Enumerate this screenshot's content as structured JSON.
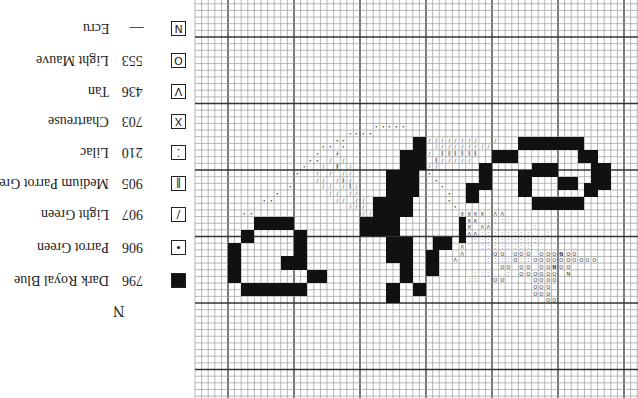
{
  "orientation": "rotated-180",
  "legend": {
    "title": "N",
    "items": [
      {
        "symbol": "N",
        "symbol_type": "letter",
        "code": "—",
        "name": "Ecru",
        "y": 21
      },
      {
        "symbol": "O",
        "symbol_type": "circle",
        "code": "553",
        "name": "Light Mauve",
        "y": 53
      },
      {
        "symbol": "V",
        "symbol_type": "v",
        "code": "436",
        "name": "Tan",
        "y": 84
      },
      {
        "symbol": "X",
        "symbol_type": "cross",
        "code": "703",
        "name": "Chartreuse",
        "y": 114
      },
      {
        "symbol": "⁚",
        "symbol_type": "two-dots",
        "code": "210",
        "name": "Lilac",
        "y": 145
      },
      {
        "symbol": "II",
        "symbol_type": "double-bar",
        "code": "905",
        "name": "Medium Parrot Green",
        "y": 176
      },
      {
        "symbol": "/",
        "symbol_type": "slash",
        "code": "907",
        "name": "Light Green",
        "y": 207
      },
      {
        "symbol": "•",
        "symbol_type": "dot",
        "code": "906",
        "name": "Parrot Green",
        "y": 240
      },
      {
        "symbol": "■",
        "symbol_type": "solid",
        "code": "796",
        "name": "Dark Royal Blue",
        "y": 273
      }
    ]
  },
  "grid": {
    "origin_x": 228,
    "origin_y": 37,
    "cell_w": 6.6,
    "cell_h": 6.65,
    "col_min": -5,
    "col_max": 62,
    "row_min": -6,
    "row_max": 54,
    "major_every": 10,
    "minor_color": "#9a9a9a",
    "major_color": "#333333"
  },
  "stitches": {
    "dark_royal_blue_rects": [
      [
        4,
        27,
        9,
        28
      ],
      [
        2,
        29,
        3,
        30
      ],
      [
        10,
        29,
        11,
        34
      ],
      [
        0,
        31,
        1,
        36
      ],
      [
        8,
        33,
        9,
        34
      ],
      [
        2,
        37,
        11,
        38
      ],
      [
        12,
        35,
        14,
        36
      ],
      [
        28,
        15,
        29,
        16
      ],
      [
        26,
        17,
        29,
        19
      ],
      [
        24,
        20,
        28,
        23
      ],
      [
        22,
        24,
        27,
        26
      ],
      [
        20,
        27,
        25,
        29
      ],
      [
        24,
        30,
        27,
        33
      ],
      [
        26,
        34,
        27,
        36
      ],
      [
        31,
        30,
        33,
        31
      ],
      [
        30,
        32,
        31,
        35
      ],
      [
        24,
        37,
        25,
        39
      ],
      [
        28,
        37,
        29,
        38
      ],
      [
        44,
        15,
        53,
        16
      ],
      [
        40,
        17,
        43,
        18
      ],
      [
        53,
        17,
        55,
        18
      ],
      [
        38,
        19,
        39,
        22
      ],
      [
        55,
        19,
        57,
        22
      ],
      [
        46,
        19,
        49,
        20
      ],
      [
        44,
        20,
        45,
        23
      ],
      [
        50,
        21,
        52,
        22
      ],
      [
        54,
        22,
        55,
        23
      ],
      [
        46,
        24,
        53,
        25
      ],
      [
        36,
        22,
        37,
        24
      ],
      [
        35,
        27,
        35,
        30
      ]
    ],
    "symbol_cells": [
      {
        "sym": "•",
        "cells": [
          [
            2,
            26
          ],
          [
            3,
            26
          ],
          [
            5,
            24
          ],
          [
            6,
            24
          ],
          [
            7,
            23
          ],
          [
            9,
            22
          ],
          [
            10,
            20
          ],
          [
            11,
            19
          ],
          [
            12,
            18
          ],
          [
            13,
            17
          ],
          [
            14,
            16
          ],
          [
            15,
            16
          ],
          [
            16,
            15
          ],
          [
            17,
            15
          ],
          [
            18,
            14
          ],
          [
            19,
            14
          ],
          [
            20,
            14
          ],
          [
            21,
            14
          ],
          [
            13,
            18
          ],
          [
            16,
            17
          ],
          [
            17,
            16
          ],
          [
            22,
            13
          ],
          [
            23,
            13
          ],
          [
            24,
            13
          ],
          [
            25,
            13
          ],
          [
            26,
            13
          ],
          [
            30,
            20
          ],
          [
            31,
            21
          ],
          [
            32,
            22
          ],
          [
            33,
            23
          ],
          [
            33,
            24
          ],
          [
            34,
            25
          ]
        ]
      },
      {
        "sym": "/",
        "cells": [
          [
            13,
            20
          ],
          [
            14,
            19
          ],
          [
            15,
            18
          ],
          [
            16,
            17
          ],
          [
            13,
            21
          ],
          [
            14,
            21
          ],
          [
            15,
            20
          ],
          [
            16,
            19
          ],
          [
            17,
            18
          ],
          [
            14,
            22
          ],
          [
            15,
            22
          ],
          [
            16,
            21
          ],
          [
            17,
            20
          ],
          [
            18,
            19
          ],
          [
            15,
            23
          ],
          [
            16,
            23
          ],
          [
            17,
            22
          ],
          [
            18,
            21
          ],
          [
            18,
            20
          ],
          [
            16,
            24
          ],
          [
            17,
            24
          ],
          [
            18,
            23
          ],
          [
            19,
            22
          ],
          [
            19,
            23
          ],
          [
            18,
            25
          ],
          [
            19,
            25
          ],
          [
            19,
            24
          ],
          [
            20,
            24
          ],
          [
            20,
            25
          ],
          [
            20,
            26
          ],
          [
            21,
            26
          ],
          [
            21,
            27
          ],
          [
            21,
            28
          ],
          [
            30,
            15
          ],
          [
            31,
            15
          ],
          [
            32,
            15
          ],
          [
            33,
            15
          ],
          [
            34,
            15
          ],
          [
            35,
            15
          ],
          [
            36,
            15
          ],
          [
            37,
            15
          ],
          [
            29,
            17
          ],
          [
            30,
            17
          ],
          [
            31,
            16
          ],
          [
            32,
            16
          ],
          [
            33,
            16
          ],
          [
            34,
            16
          ],
          [
            35,
            16
          ],
          [
            36,
            16
          ],
          [
            37,
            16
          ],
          [
            38,
            16
          ],
          [
            39,
            16
          ],
          [
            30,
            19
          ],
          [
            31,
            19
          ],
          [
            32,
            18
          ],
          [
            33,
            18
          ],
          [
            34,
            18
          ],
          [
            35,
            18
          ],
          [
            36,
            18
          ],
          [
            40,
            15
          ]
        ]
      },
      {
        "sym": "II",
        "cells": [
          [
            16,
            19
          ],
          [
            17,
            21
          ],
          [
            18,
            22
          ],
          [
            32,
            17
          ],
          [
            33,
            17
          ],
          [
            34,
            17
          ],
          [
            35,
            17
          ],
          [
            36,
            17
          ],
          [
            37,
            17
          ],
          [
            31,
            18
          ]
        ]
      },
      {
        "sym": "X",
        "cells": [
          [
            35,
            26
          ],
          [
            36,
            26
          ],
          [
            37,
            26
          ],
          [
            38,
            26
          ],
          [
            35,
            27
          ],
          [
            36,
            27
          ],
          [
            37,
            27
          ],
          [
            36,
            28
          ],
          [
            35,
            29
          ]
        ]
      },
      {
        "sym": "V",
        "cells": [
          [
            38,
            28
          ],
          [
            39,
            28
          ],
          [
            40,
            26
          ],
          [
            41,
            26
          ],
          [
            36,
            29
          ],
          [
            37,
            29
          ],
          [
            35,
            30
          ],
          [
            35,
            31
          ],
          [
            35,
            32
          ],
          [
            34,
            33
          ]
        ]
      },
      {
        "sym": "⁚",
        "cells": [
          [
            39,
            27
          ],
          [
            40,
            27
          ],
          [
            41,
            27
          ],
          [
            42,
            27
          ],
          [
            38,
            29
          ],
          [
            39,
            29
          ],
          [
            40,
            29
          ],
          [
            41,
            29
          ],
          [
            42,
            29
          ],
          [
            43,
            29
          ],
          [
            44,
            29
          ],
          [
            45,
            29
          ],
          [
            46,
            28
          ],
          [
            37,
            30
          ],
          [
            38,
            30
          ],
          [
            39,
            30
          ],
          [
            40,
            30
          ],
          [
            41,
            30
          ],
          [
            42,
            30
          ],
          [
            43,
            30
          ],
          [
            44,
            30
          ],
          [
            45,
            30
          ],
          [
            46,
            30
          ],
          [
            47,
            30
          ],
          [
            48,
            29
          ],
          [
            38,
            31
          ],
          [
            39,
            31
          ],
          [
            40,
            31
          ],
          [
            41,
            31
          ],
          [
            42,
            31
          ],
          [
            43,
            31
          ],
          [
            44,
            31
          ],
          [
            45,
            31
          ],
          [
            39,
            33
          ],
          [
            40,
            33
          ],
          [
            41,
            33
          ],
          [
            42,
            33
          ],
          [
            44,
            33
          ],
          [
            45,
            33
          ],
          [
            37,
            35
          ],
          [
            38,
            35
          ],
          [
            39,
            35
          ],
          [
            36,
            36
          ],
          [
            37,
            36
          ],
          [
            42,
            35
          ]
        ]
      },
      {
        "sym": "O",
        "cells": [
          [
            40,
            32
          ],
          [
            41,
            32
          ],
          [
            43,
            32
          ],
          [
            44,
            32
          ],
          [
            45,
            32
          ],
          [
            47,
            32
          ],
          [
            48,
            32
          ],
          [
            49,
            32
          ],
          [
            50,
            32
          ],
          [
            51,
            32
          ],
          [
            52,
            32
          ],
          [
            43,
            33
          ],
          [
            46,
            33
          ],
          [
            47,
            33
          ],
          [
            48,
            33
          ],
          [
            49,
            33
          ],
          [
            50,
            33
          ],
          [
            51,
            33
          ],
          [
            52,
            33
          ],
          [
            53,
            33
          ],
          [
            54,
            33
          ],
          [
            55,
            33
          ],
          [
            41,
            34
          ],
          [
            42,
            34
          ],
          [
            44,
            34
          ],
          [
            45,
            34
          ],
          [
            47,
            34
          ],
          [
            48,
            34
          ],
          [
            49,
            34
          ],
          [
            50,
            34
          ],
          [
            51,
            34
          ],
          [
            44,
            35
          ],
          [
            45,
            35
          ],
          [
            46,
            35
          ],
          [
            47,
            35
          ],
          [
            48,
            35
          ],
          [
            49,
            35
          ],
          [
            40,
            36
          ],
          [
            41,
            36
          ],
          [
            46,
            36
          ],
          [
            47,
            36
          ],
          [
            48,
            36
          ],
          [
            49,
            36
          ],
          [
            46,
            37
          ],
          [
            47,
            37
          ],
          [
            48,
            37
          ],
          [
            46,
            38
          ],
          [
            47,
            38
          ],
          [
            48,
            38
          ],
          [
            48,
            39
          ],
          [
            49,
            39
          ]
        ]
      },
      {
        "sym": "N",
        "cells": [
          [
            50,
            32
          ],
          [
            49,
            34
          ],
          [
            51,
            35
          ]
        ]
      }
    ]
  }
}
